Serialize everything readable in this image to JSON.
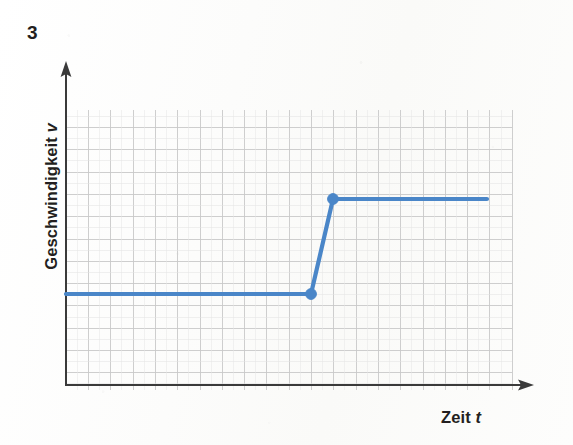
{
  "figure": {
    "exercise_number": "3",
    "y_axis_label_text": "Geschwindigkeit",
    "y_axis_variable": "v",
    "x_axis_label_text": "Zeit",
    "x_axis_variable": "t",
    "background_color": "#fdfdfc",
    "axis_color": "#3a3a3a",
    "grid_color": "#c9c9c9",
    "curve_color": "#4a86c8"
  },
  "chart_data": {
    "type": "line",
    "title": "",
    "subtitle": "",
    "xlabel": "Zeit t",
    "ylabel": "Geschwindigkeit v",
    "xlim": [
      0,
      20
    ],
    "ylim": [
      0,
      12
    ],
    "grid": true,
    "grid_spacing_px": 22.3,
    "legend": "none",
    "axis_ticks": "none",
    "axis_tick_labels": "none",
    "series": [
      {
        "name": "v(t)",
        "color": "#4a86c8",
        "points_px": [
          {
            "x": 66,
            "y": 294
          },
          {
            "x": 311,
            "y": 294
          },
          {
            "x": 333,
            "y": 199
          },
          {
            "x": 487,
            "y": 199
          }
        ],
        "points_data": [
          {
            "x": 0.0,
            "y": 4.1
          },
          {
            "x": 11.0,
            "y": 4.1
          },
          {
            "x": 12.0,
            "y": 8.3
          },
          {
            "x": 18.9,
            "y": 8.3
          }
        ],
        "markers_px": [
          {
            "x": 311,
            "y": 294
          },
          {
            "x": 333,
            "y": 199
          }
        ],
        "markers_data": [
          {
            "x": 11.0,
            "y": 4.1
          },
          {
            "x": 12.0,
            "y": 8.3
          }
        ]
      }
    ]
  },
  "geometry": {
    "origin": {
      "x": 66,
      "y": 385
    },
    "y_axis_top": 62,
    "x_axis_right": 533,
    "grid_left": 66,
    "grid_right": 512,
    "grid_top": 110,
    "grid_bottom": 390,
    "vertical_grid_x": [
      66,
      88.5,
      110.8,
      133.1,
      155.4,
      177.7,
      200,
      222.3,
      244.6,
      266.9,
      289.2,
      311.5,
      333.8,
      356.1,
      378.4,
      400.7,
      423,
      445.3,
      467.6,
      489.9,
      512
    ],
    "horizontal_grid_y": [
      127.5,
      149.8,
      172.1,
      194.4,
      216.7,
      239,
      261.3,
      283.6,
      294,
      305.9,
      328.2,
      350.5,
      372.8,
      390
    ]
  }
}
